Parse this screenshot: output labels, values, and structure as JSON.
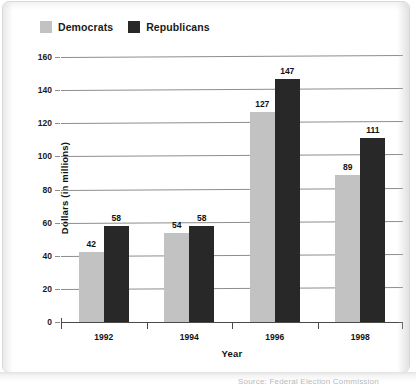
{
  "chart_data": {
    "type": "bar",
    "title": "",
    "subtitle": "",
    "xlabel": "Year",
    "ylabel": "Dollars (in millions)",
    "categories": [
      "1992",
      "1994",
      "1996",
      "1998"
    ],
    "series": [
      {
        "name": "Democrats",
        "color": "#c2c2c2",
        "values": [
          42,
          54,
          127,
          89
        ]
      },
      {
        "name": "Republicans",
        "color": "#282828",
        "values": [
          58,
          58,
          147,
          111
        ]
      }
    ],
    "ylim": [
      0,
      160
    ],
    "ytick_values": [
      0,
      20,
      40,
      60,
      80,
      100,
      120,
      140,
      160
    ],
    "ytick_labels": [
      "0",
      "20",
      "40",
      "60",
      "80",
      "100",
      "120",
      "140",
      "160"
    ],
    "grid": true,
    "grid_axis": "y",
    "legend_position": "top-left",
    "data_labels": true,
    "bar_grouping": "grouped-adjacent"
  },
  "legend": {
    "entries": [
      {
        "label": "Democrats",
        "swatch_color": "#c2c2c2"
      },
      {
        "label": "Republicans",
        "swatch_color": "#282828"
      }
    ]
  },
  "axes": {
    "y_title": "Dollars (in millions)",
    "x_title": "Year"
  },
  "caption": {
    "text": "Source: Federal Election Commission"
  },
  "colors": {
    "democrat": "#c2c2c2",
    "republican": "#282828",
    "gridline": "#8d8d8d",
    "axis": "#4a4a4a",
    "text": "#111111",
    "card_border": "#d8d8d8",
    "background": "#ffffff"
  }
}
